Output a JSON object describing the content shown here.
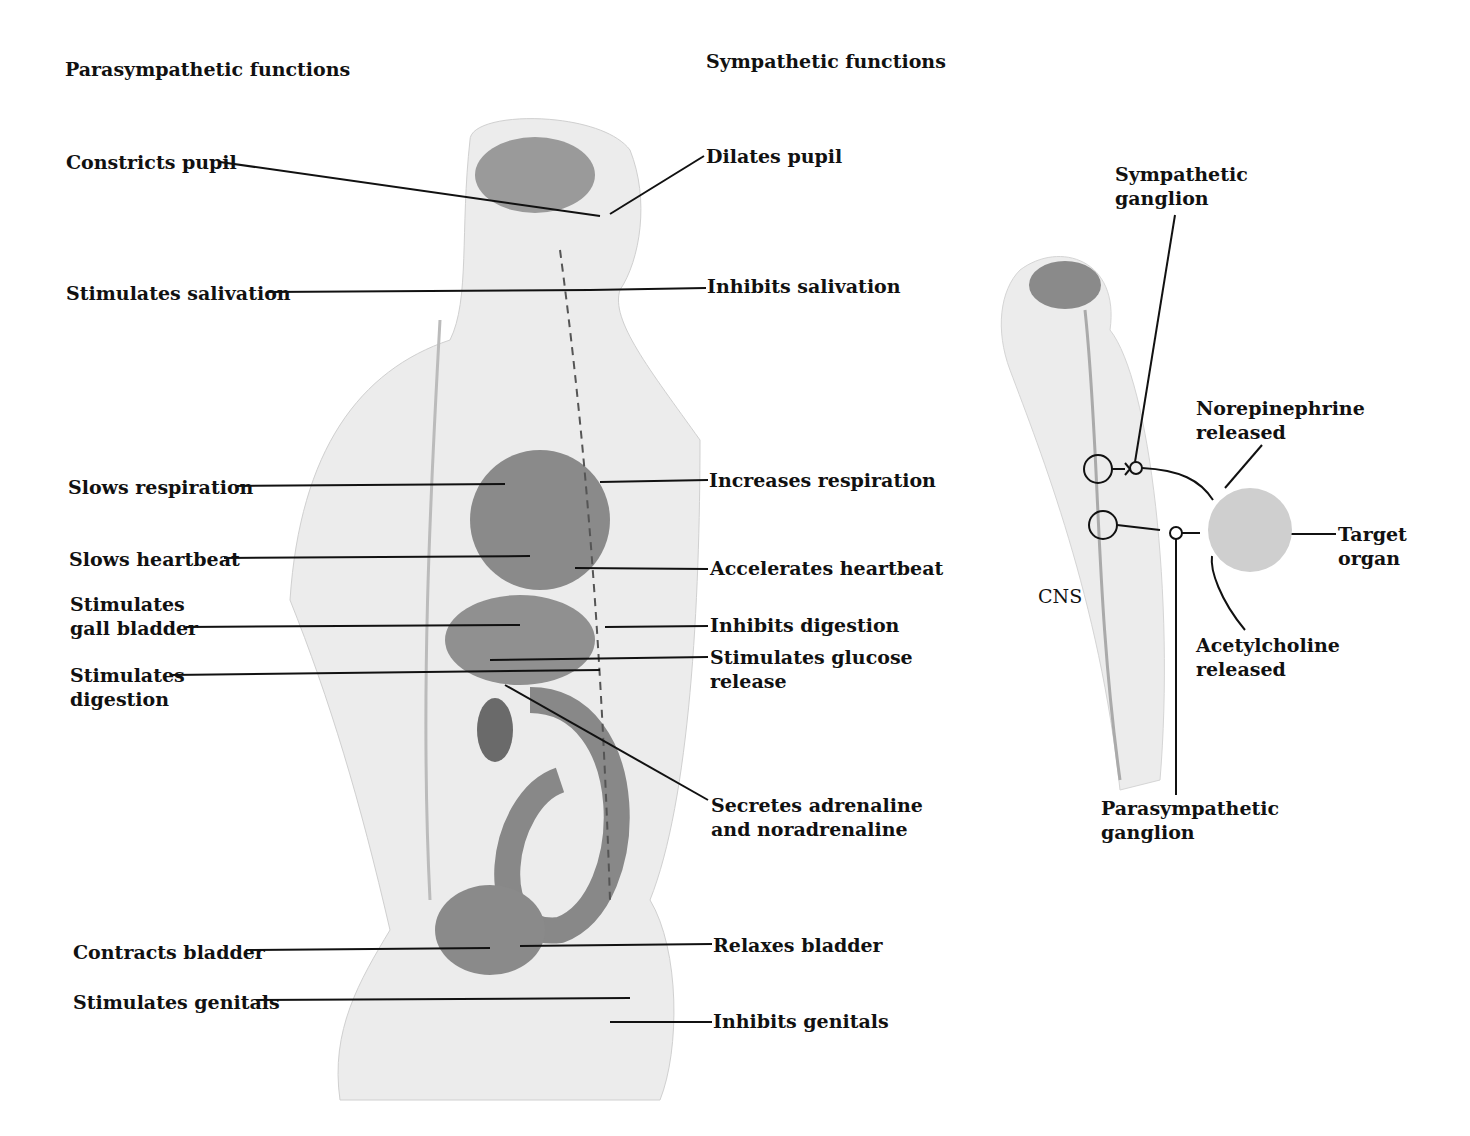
{
  "headers": {
    "parasympathetic": "Parasympathetic functions",
    "sympathetic": "Sympathetic functions"
  },
  "parasympathetic_labels": [
    "Constricts pupil",
    "Stimulates salivation",
    "Slows respiration",
    "Slows heartbeat",
    "Stimulates\ngall bladder",
    "Stimulates\ndigestion",
    "Contracts bladder",
    "Stimulates genitals"
  ],
  "sympathetic_labels": [
    "Dilates pupil",
    "Inhibits salivation",
    "Increases respiration",
    "Accelerates heartbeat",
    "Inhibits digestion",
    "Stimulates glucose\nrelease",
    "Secretes adrenaline\nand noradrenaline",
    "Relaxes bladder",
    "Inhibits genitals"
  ],
  "inset": {
    "sympathetic_ganglion": "Sympathetic\nganglion",
    "norepinephrine": "Norepinephrine\nreleased",
    "target_organ": "Target\norgan",
    "cns": "CNS",
    "acetylcholine": "Acetylcholine\nreleased",
    "parasympathetic_ganglion": "Parasympathetic\nganglion"
  },
  "colors": {
    "body": "#e6e6e6",
    "organ": "#9a9a9a",
    "target": "#cfcfcf"
  }
}
